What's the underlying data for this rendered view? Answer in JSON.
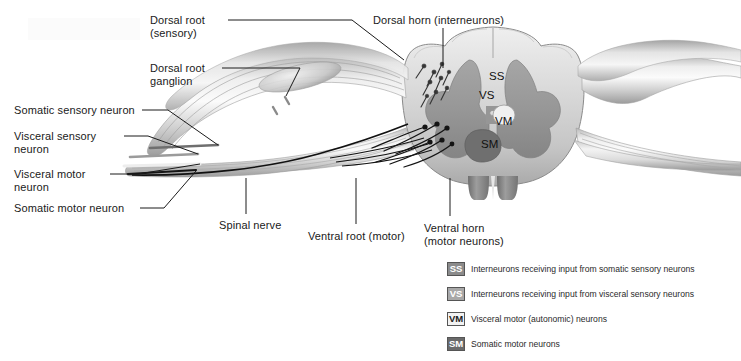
{
  "figure": {
    "background": "#ffffff"
  },
  "labels": [
    {
      "id": "dorsal-root",
      "text": "Dorsal root\n(sensory)",
      "x": 150,
      "y": 14,
      "align": "left"
    },
    {
      "id": "dorsal-root-ganglion",
      "text": "Dorsal root\nganglion",
      "x": 150,
      "y": 62,
      "align": "left"
    },
    {
      "id": "somatic-sensory-neuron",
      "text": "Somatic sensory neuron",
      "x": 14,
      "y": 104,
      "align": "left"
    },
    {
      "id": "visceral-sensory-neuron",
      "text": "Visceral sensory\nneuron",
      "x": 14,
      "y": 130,
      "align": "left"
    },
    {
      "id": "visceral-motor-neuron",
      "text": "Visceral motor\nneuron",
      "x": 14,
      "y": 168,
      "align": "left"
    },
    {
      "id": "somatic-motor-neuron",
      "text": "Somatic motor neuron",
      "x": 14,
      "y": 202,
      "align": "left"
    },
    {
      "id": "spinal-nerve",
      "text": "Spinal nerve",
      "x": 219,
      "y": 219,
      "align": "left"
    },
    {
      "id": "ventral-root",
      "text": "Ventral root (motor)",
      "x": 308,
      "y": 230,
      "align": "left"
    },
    {
      "id": "ventral-horn",
      "text": "Ventral horn\n(motor neurons)",
      "x": 424,
      "y": 222,
      "align": "left"
    },
    {
      "id": "dorsal-horn",
      "text": "Dorsal horn (interneurons)",
      "x": 373,
      "y": 14,
      "align": "left"
    }
  ],
  "horn_markers": [
    {
      "id": "ss",
      "text": "SS",
      "x": 489,
      "y": 70
    },
    {
      "id": "vs",
      "text": "VS",
      "x": 479,
      "y": 89
    },
    {
      "id": "vm",
      "text": "VM",
      "x": 495,
      "y": 115
    },
    {
      "id": "sm",
      "text": "SM",
      "x": 481,
      "y": 138
    }
  ],
  "legend": {
    "items": [
      {
        "key": "SS",
        "fill": "#8b8b8b",
        "text_color": "#ffffff",
        "description": "Interneurons receiving input from somatic sensory neurons"
      },
      {
        "key": "VS",
        "fill": "#a8a8a8",
        "text_color": "#ffffff",
        "description": "Interneurons receiving input from visceral sensory neurons"
      },
      {
        "key": "VM",
        "fill": "#f2f2f2",
        "text_color": "#1a1a1a",
        "description": "Visceral motor (autonomic) neurons"
      },
      {
        "key": "SM",
        "fill": "#6a6a6a",
        "text_color": "#ffffff",
        "description": "Somatic motor neurons"
      }
    ]
  },
  "colors": {
    "leader_line": "#1a1a1a",
    "gray_matter": "#9a9a9a",
    "gray_matter_dark": "#8a8a8a",
    "white_matter": "#d8d8d8",
    "cord_outline": "#7a7a7a",
    "nerve_light": "#e8e8e8",
    "nerve_mid": "#b5b5b5",
    "nerve_dark": "#6f6f6f",
    "axon_black": "#111111",
    "sm_nucleus": "#707070"
  }
}
